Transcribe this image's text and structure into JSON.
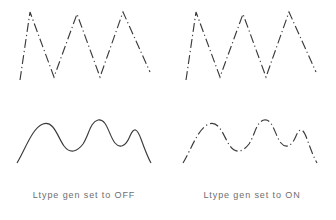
{
  "figure": {
    "background_color": "#ffffff",
    "stroke_color": "#3a3a3a",
    "caption_color": "#6e6e6e",
    "width": 336,
    "height": 220
  },
  "panels": [
    {
      "id": "left",
      "caption": "Ltype gen set to OFF",
      "rows": [
        {
          "id": "zigzag",
          "shape_name": "zigzag-polyline",
          "linetype": "dash-dot",
          "dasharray": "9 3 1.2 3",
          "rendered_as": "dashed",
          "points": "20,80 30,12 54,77 77,14 100,77 123,12 150,72"
        },
        {
          "id": "spline",
          "shape_name": "spline-curve",
          "linetype": "dash-dot",
          "dasharray": "none",
          "rendered_as": "continuous",
          "path": "M17,163 C25,150 32,128 43,124 C54,120 58,138 64,146 C70,154 77,152 83,144 C89,135 90,122 98,120 C107,118 109,136 115,143 C120,149 126,146 130,136 C134,127 137,128 141,139 C145,150 148,158 151,163"
        }
      ]
    },
    {
      "id": "right",
      "caption": "Ltype gen set to ON",
      "rows": [
        {
          "id": "zigzag",
          "shape_name": "zigzag-polyline",
          "linetype": "dash-dot",
          "dasharray": "9 3 1.2 3",
          "rendered_as": "dashed",
          "points": "18,80 28,12 52,77 75,14 98,77 121,12 148,72"
        },
        {
          "id": "spline",
          "shape_name": "spline-curve",
          "linetype": "dash-dot",
          "dasharray": "9 3 1.2 3",
          "rendered_as": "dashed",
          "path": "M15,163 C23,150 30,128 41,124 C52,120 56,138 62,146 C68,154 75,152 81,144 C87,135 88,122 96,120 C105,118 107,136 113,143 C118,149 124,146 128,136 C132,127 135,128 139,139 C143,150 146,158 149,163"
        }
      ]
    }
  ]
}
